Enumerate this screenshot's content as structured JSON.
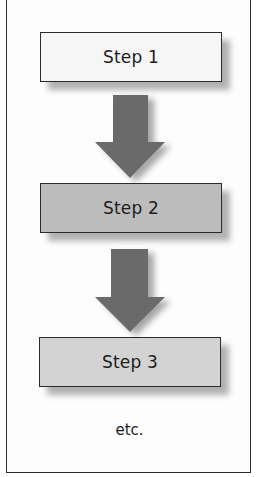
{
  "diagram": {
    "type": "vertical-flow",
    "steps": [
      {
        "label": "Step 1",
        "fill": "#f6f6f6"
      },
      {
        "label": "Step 2",
        "fill": "#bcbcbc"
      },
      {
        "label": "Step 3",
        "fill": "#d3d3d3"
      }
    ],
    "arrows": [
      {
        "from": "Step 1",
        "to": "Step 2",
        "color": "#6b6b6b",
        "icon": "arrow-down-icon"
      },
      {
        "from": "Step 2",
        "to": "Step 3",
        "color": "#6b6b6b",
        "icon": "arrow-down-icon"
      }
    ],
    "continuation_label": "etc.",
    "border_color": "#2a2a2a"
  }
}
